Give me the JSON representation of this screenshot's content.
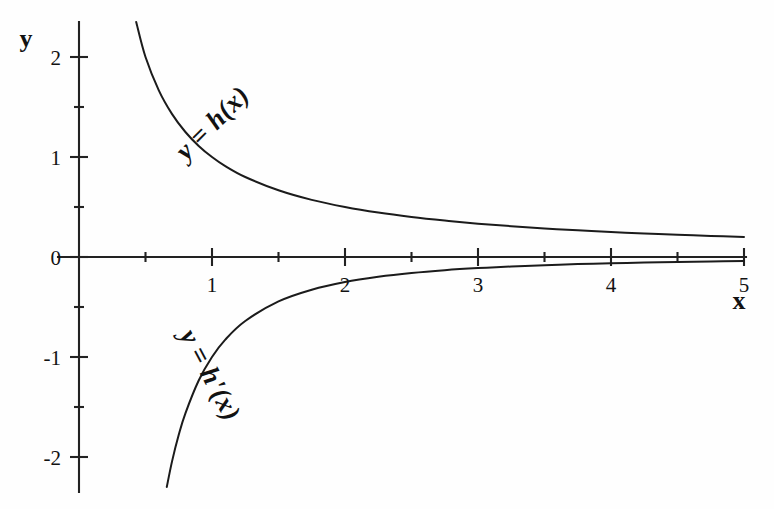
{
  "figure": {
    "title": "",
    "background_color": "#fefefe",
    "ink_color": "#1b1b1b"
  },
  "axes": {
    "x_axis_name": "x",
    "y_axis_name": "y",
    "x_tick_labels": [
      "1",
      "2",
      "3",
      "4",
      "5"
    ],
    "y_tick_labels": [
      "2",
      "1",
      "0",
      "-1",
      "-2"
    ]
  },
  "chart_data": {
    "type": "line",
    "title": "",
    "xlabel": "x",
    "ylabel": "y",
    "xlim": [
      0,
      5.2
    ],
    "ylim": [
      -2.35,
      2.4
    ],
    "xticks": [
      1,
      2,
      3,
      4,
      5
    ],
    "xticks_minor": [
      0.5,
      1.5,
      2.5,
      3.5,
      4.5
    ],
    "yticks": [
      -2,
      -1,
      0,
      1,
      2
    ],
    "yticks_minor": [
      -1.5,
      -0.5,
      0.5,
      1.5
    ],
    "grid": false,
    "legend": "inline-curve-labels",
    "series": [
      {
        "name": "y = h(x)",
        "label": "y = h(x)",
        "expression": "1/x",
        "label_rotation_deg": 45,
        "label_x": 1.05,
        "label_y": 1.28,
        "x": [
          0.43,
          0.5,
          0.6,
          0.7,
          0.8,
          0.9,
          1.0,
          1.1,
          1.25,
          1.5,
          1.75,
          2.0,
          2.25,
          2.5,
          2.75,
          3.0,
          3.25,
          3.5,
          3.75,
          4.0,
          4.25,
          4.5,
          4.75,
          5.0
        ],
        "y": [
          2.35,
          2.0,
          1.667,
          1.429,
          1.25,
          1.111,
          1.0,
          0.909,
          0.8,
          0.667,
          0.571,
          0.5,
          0.444,
          0.4,
          0.364,
          0.333,
          0.308,
          0.286,
          0.267,
          0.25,
          0.235,
          0.222,
          0.211,
          0.2
        ]
      },
      {
        "name": "y = h'(x)",
        "label": "y = h'(x)",
        "expression": "-1/x^2",
        "label_rotation_deg": -62,
        "label_x": 0.93,
        "label_y": -1.22,
        "x": [
          0.66,
          0.7,
          0.75,
          0.8,
          0.9,
          1.0,
          1.1,
          1.25,
          1.5,
          1.75,
          2.0,
          2.25,
          2.5,
          2.75,
          3.0,
          3.25,
          3.5,
          3.75,
          4.0,
          4.25,
          4.5,
          4.75,
          5.0
        ],
        "y": [
          -2.3,
          -2.041,
          -1.778,
          -1.563,
          -1.235,
          -1.0,
          -0.826,
          -0.64,
          -0.444,
          -0.327,
          -0.25,
          -0.198,
          -0.16,
          -0.132,
          -0.111,
          -0.095,
          -0.082,
          -0.071,
          -0.063,
          -0.055,
          -0.049,
          -0.044,
          -0.04
        ]
      }
    ]
  }
}
